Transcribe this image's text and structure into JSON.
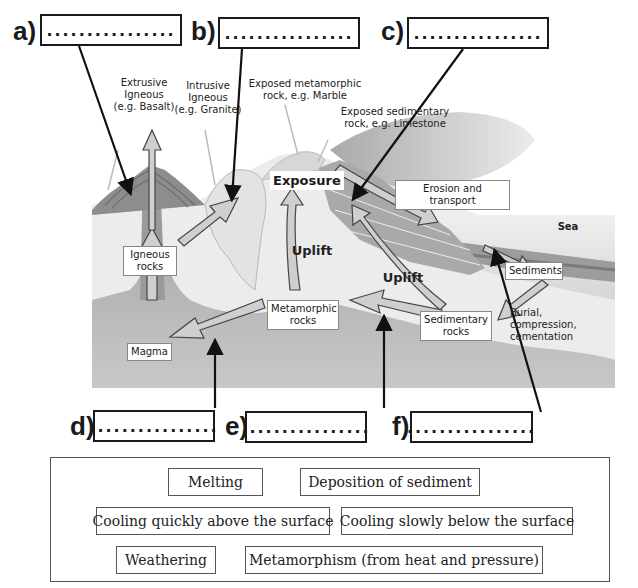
{
  "answer_boxes": [
    {
      "id": "a",
      "label": "a)",
      "placeholder": "................"
    },
    {
      "id": "b",
      "label": "b)",
      "placeholder": "................"
    },
    {
      "id": "c",
      "label": "c)",
      "placeholder": "................"
    },
    {
      "id": "d",
      "label": "d)",
      "placeholder": "................"
    },
    {
      "id": "e",
      "label": "e)",
      "placeholder": "................"
    },
    {
      "id": "f",
      "label": "f)",
      "placeholder": "................"
    }
  ],
  "diagram": {
    "annotations": {
      "extrusive": "Extrusive Igneous (e.g. Basalt)",
      "extrusive_l1": "Extrusive",
      "extrusive_l2": "Igneous",
      "extrusive_l3": "(e.g. Basalt)",
      "intrusive_l1": "Intrusive",
      "intrusive_l2": "Igneous",
      "intrusive_l3": "(e.g. Granite)",
      "exposed_meta_l1": "Exposed metamorphic",
      "exposed_meta_l2": "rock, e.g. Marble",
      "exposed_sed_l1": "Exposed sedimentary",
      "exposed_sed_l2": "rock, e.g. Limestone",
      "uplift_1": "Uplift",
      "uplift_2": "Uplift",
      "sea": "Sea",
      "burial_l1": "Burial,",
      "burial_l2": "compression,",
      "burial_l3": "cementation"
    },
    "boxes": {
      "exposure": "Exposure",
      "erosion": "Erosion and transport",
      "igneous_l1": "Igneous",
      "igneous_l2": "rocks",
      "metamorphic_l1": "Metamorphic",
      "metamorphic_l2": "rocks",
      "sedimentary_l1": "Sedimentary",
      "sedimentary_l2": "rocks",
      "sediments": "Sediments",
      "magma": "Magma"
    },
    "colors": {
      "ground": "#e9e9e9",
      "mantle": "#b5b5b5",
      "volcano": "#8d8d8d",
      "sea": "#dcdcdc",
      "arrow_fill": "#cfcfcf",
      "pointer": "#111111"
    }
  },
  "word_bank": {
    "items": [
      "Melting",
      "Deposition of sediment",
      "Cooling quickly above the surface",
      "Cooling slowly below the surface",
      "Weathering",
      "Metamorphism (from heat and pressure)"
    ]
  }
}
